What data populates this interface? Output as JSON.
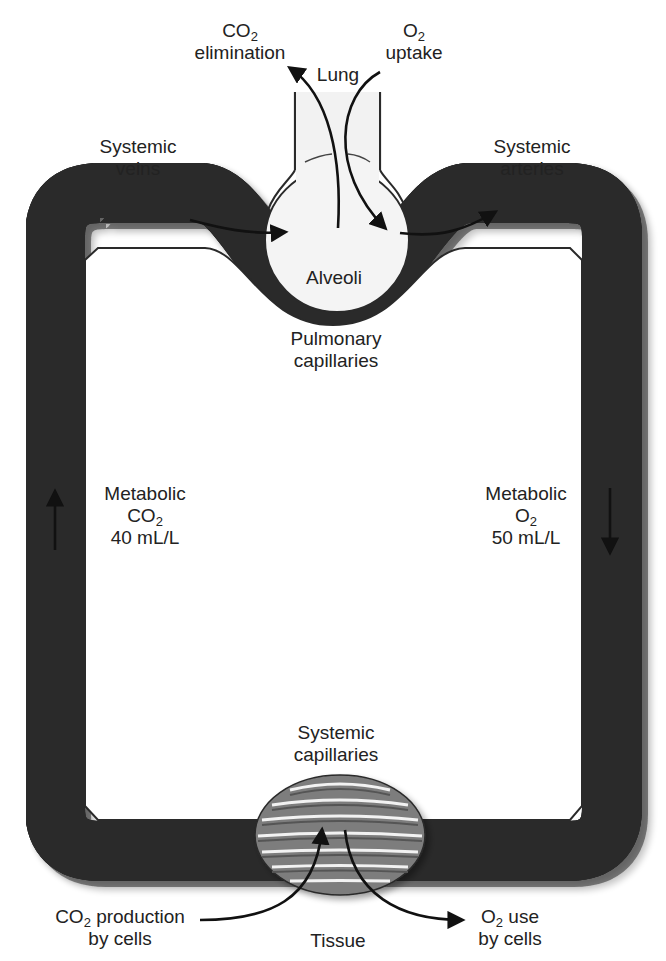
{
  "diagram": {
    "colors": {
      "vessel_outer": "#7d7d7d",
      "vessel_light": "#a6a6a6",
      "vessel_dark": "#6a6a6a",
      "outline": "#2a2a2a",
      "alveolus_fill": "#f4f4f4",
      "arrow": "#111111",
      "text": "#222222"
    },
    "lung": {
      "title": "Lung",
      "co2": {
        "prefix": "CO",
        "sub": "2",
        "line2": "elimination"
      },
      "o2": {
        "prefix": "O",
        "sub": "2",
        "line2": "uptake"
      },
      "alveoli": "Alveoli",
      "pulmonary": {
        "line1": "Pulmonary",
        "line2": "capillaries"
      }
    },
    "systemic_veins": {
      "line1": "Systemic",
      "line2": "veins"
    },
    "systemic_arteries": {
      "line1": "Systemic",
      "line2": "arteries"
    },
    "metabolic_co2": {
      "line1": "Metabolic",
      "prefix": "CO",
      "sub": "2",
      "line3": "40 mL/L"
    },
    "metabolic_o2": {
      "line1": "Metabolic",
      "prefix": "O",
      "sub": "2",
      "line3": "50 mL/L"
    },
    "systemic_capillaries": {
      "line1": "Systemic",
      "line2": "capillaries"
    },
    "tissue": {
      "title": "Tissue",
      "co2_production": {
        "prefix": "CO",
        "sub": "2",
        "rest": " production",
        "line2": "by cells"
      },
      "o2_use": {
        "prefix": "O",
        "sub": "2",
        "rest": " use",
        "line2": "by cells"
      }
    },
    "flow": {
      "left_direction": "up",
      "right_direction": "down"
    }
  }
}
